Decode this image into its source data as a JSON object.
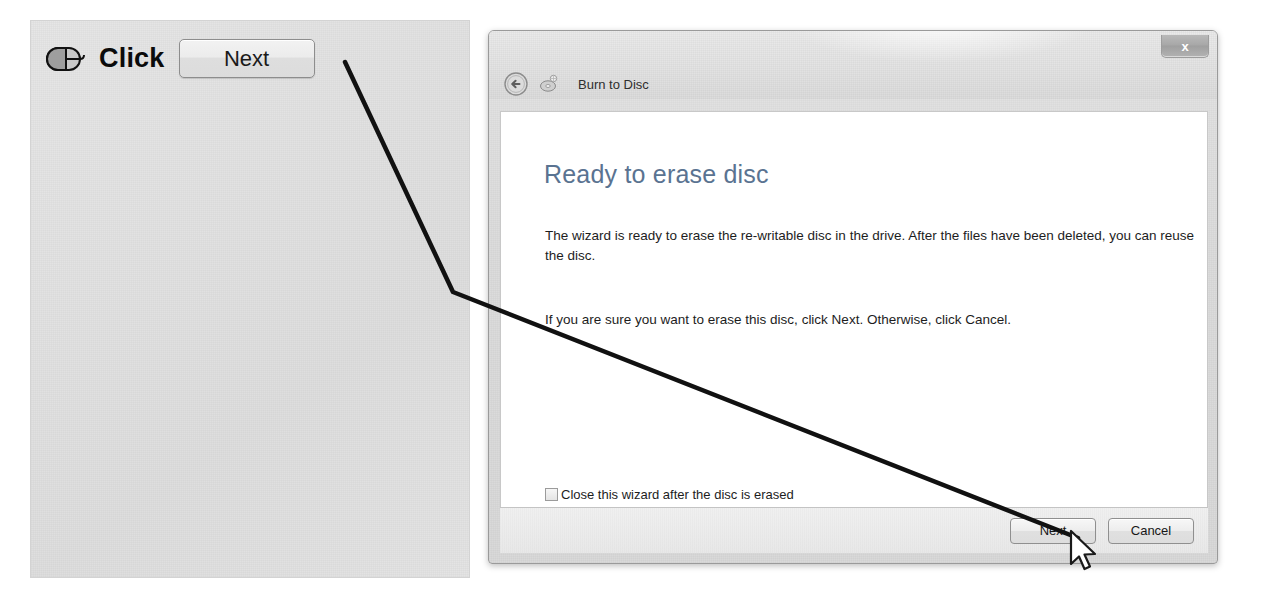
{
  "annotation": {
    "mouse_icon": "mouse-left-click-icon",
    "instruction": "Click",
    "target_button_label": "Next",
    "leader_line_color": "#111111"
  },
  "dialog": {
    "title": "Burn to Disc",
    "back_icon": "back-arrow-icon",
    "titlebar_icon": "disc-burn-icon",
    "close_label": "x",
    "heading": "Ready to erase disc",
    "paragraph_1": "The wizard is ready to erase the re-writable disc in the drive. After the files have been deleted, you can reuse the disc.",
    "paragraph_2": "If you are sure you want to erase this disc, click Next. Otherwise, click Cancel.",
    "checkbox": {
      "label": "Close this wizard after the disc is erased",
      "checked": false
    },
    "buttons": {
      "next": "Next",
      "cancel": "Cancel"
    },
    "heading_color": "#5a7391"
  },
  "cursor": {
    "type": "arrow-pointer",
    "x": 1068,
    "y": 529
  }
}
